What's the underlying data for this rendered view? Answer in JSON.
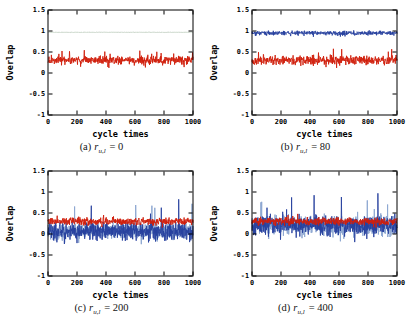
{
  "figure": {
    "background": "#ffffff",
    "frame_color": "#000000",
    "red_color": "#d01f0c",
    "blue_color": "#27419e",
    "light_blue_color": "#8ea8d2",
    "flat_line_color": "#b5c7b5"
  },
  "axes": {
    "ylabel": "Overlap",
    "xlabel": "cycle times",
    "ylim": [
      -1,
      1.5
    ],
    "xlim": [
      0,
      1000
    ],
    "yticks": [
      {
        "value": 1.5,
        "label": "1.5"
      },
      {
        "value": 1,
        "label": "1"
      },
      {
        "value": 0.5,
        "label": "0.5"
      },
      {
        "value": 0,
        "label": "0"
      },
      {
        "value": -0.5,
        "label": "-0.5"
      },
      {
        "value": -1,
        "label": "-1"
      }
    ],
    "xticks": [
      {
        "value": 0,
        "label": "0"
      },
      {
        "value": 200,
        "label": "200"
      },
      {
        "value": 400,
        "label": "400"
      },
      {
        "value": 600,
        "label": "600"
      },
      {
        "value": 800,
        "label": "800"
      },
      {
        "value": 1000,
        "label": "1000"
      }
    ]
  },
  "chart_data": [
    {
      "type": "line",
      "panel": "a",
      "caption": {
        "index": "(a)",
        "variable": "r",
        "subscript": "u,l",
        "equation": "= 0"
      },
      "xlabel": "cycle times",
      "ylabel": "Overlap",
      "xlim": [
        0,
        1000
      ],
      "ylim": [
        -1,
        1.5
      ],
      "series": [
        {
          "name": "flat-overlap-line",
          "color": "#b5c7b5",
          "mean": 0.97,
          "noise": 0.005,
          "spike_prob": 0,
          "spike_up": 0,
          "spike_down": 0,
          "seed": 11,
          "width": 0.8
        },
        {
          "name": "red-overlap-trace",
          "color": "#d01f0c",
          "mean": 0.31,
          "noise": 0.095,
          "spike_prob": 0.012,
          "spike_up": 0.26,
          "spike_down": 0.22,
          "seed": 12,
          "width": 0.9
        }
      ]
    },
    {
      "type": "line",
      "panel": "b",
      "caption": {
        "index": "(b)",
        "variable": "r",
        "subscript": "u,l",
        "equation": "= 80"
      },
      "xlabel": "cycle times",
      "ylabel": "Overlap",
      "xlim": [
        0,
        1000
      ],
      "ylim": [
        -1,
        1.5
      ],
      "series": [
        {
          "name": "blue-overlap-trace",
          "color": "#27419e",
          "mean": 0.95,
          "noise": 0.05,
          "spike_prob": 0.008,
          "spike_up": 0.06,
          "spike_down": 0.09,
          "seed": 21,
          "width": 0.9
        },
        {
          "name": "red-overlap-trace",
          "color": "#d01f0c",
          "mean": 0.3,
          "noise": 0.1,
          "spike_prob": 0.012,
          "spike_up": 0.28,
          "spike_down": 0.2,
          "seed": 22,
          "width": 0.9
        }
      ]
    },
    {
      "type": "line",
      "panel": "c",
      "caption": {
        "index": "(c)",
        "variable": "r",
        "subscript": "u,l",
        "equation": "= 200"
      },
      "xlabel": "cycle times",
      "ylabel": "Overlap",
      "xlim": [
        0,
        1000
      ],
      "ylim": [
        -1,
        1.5
      ],
      "series": [
        {
          "name": "light-blue-overlap-trace",
          "color": "#8ea8d2",
          "mean": 0.07,
          "noise": 0.19,
          "spike_prob": 0.012,
          "spike_up": 0.8,
          "spike_down": 0.33,
          "seed": 31,
          "width": 1.0
        },
        {
          "name": "blue-overlap-trace",
          "color": "#27419e",
          "mean": 0.07,
          "noise": 0.19,
          "spike_prob": 0.012,
          "spike_up": 0.88,
          "spike_down": 0.33,
          "seed": 32,
          "width": 0.9
        },
        {
          "name": "red-overlap-trace",
          "color": "#d01f0c",
          "mean": 0.3,
          "noise": 0.085,
          "spike_prob": 0.008,
          "spike_up": 0.18,
          "spike_down": 0.15,
          "seed": 33,
          "width": 0.9
        }
      ]
    },
    {
      "type": "line",
      "panel": "d",
      "caption": {
        "index": "(d)",
        "variable": "r",
        "subscript": "u,l",
        "equation": "= 400"
      },
      "xlabel": "cycle times",
      "ylabel": "Overlap",
      "xlim": [
        0,
        1000
      ],
      "ylim": [
        -1,
        1.5
      ],
      "series": [
        {
          "name": "light-blue-overlap-trace",
          "color": "#8ea8d2",
          "mean": 0.2,
          "noise": 0.23,
          "spike_prob": 0.01,
          "spike_up": 0.7,
          "spike_down": 0.4,
          "seed": 41,
          "width": 1.0
        },
        {
          "name": "blue-overlap-trace",
          "color": "#27419e",
          "mean": 0.2,
          "noise": 0.23,
          "spike_prob": 0.01,
          "spike_up": 0.8,
          "spike_down": 0.4,
          "seed": 42,
          "width": 0.9
        },
        {
          "name": "red-overlap-trace",
          "color": "#d01f0c",
          "mean": 0.3,
          "noise": 0.085,
          "spike_prob": 0.008,
          "spike_up": 0.18,
          "spike_down": 0.15,
          "seed": 43,
          "width": 0.9
        }
      ]
    }
  ]
}
